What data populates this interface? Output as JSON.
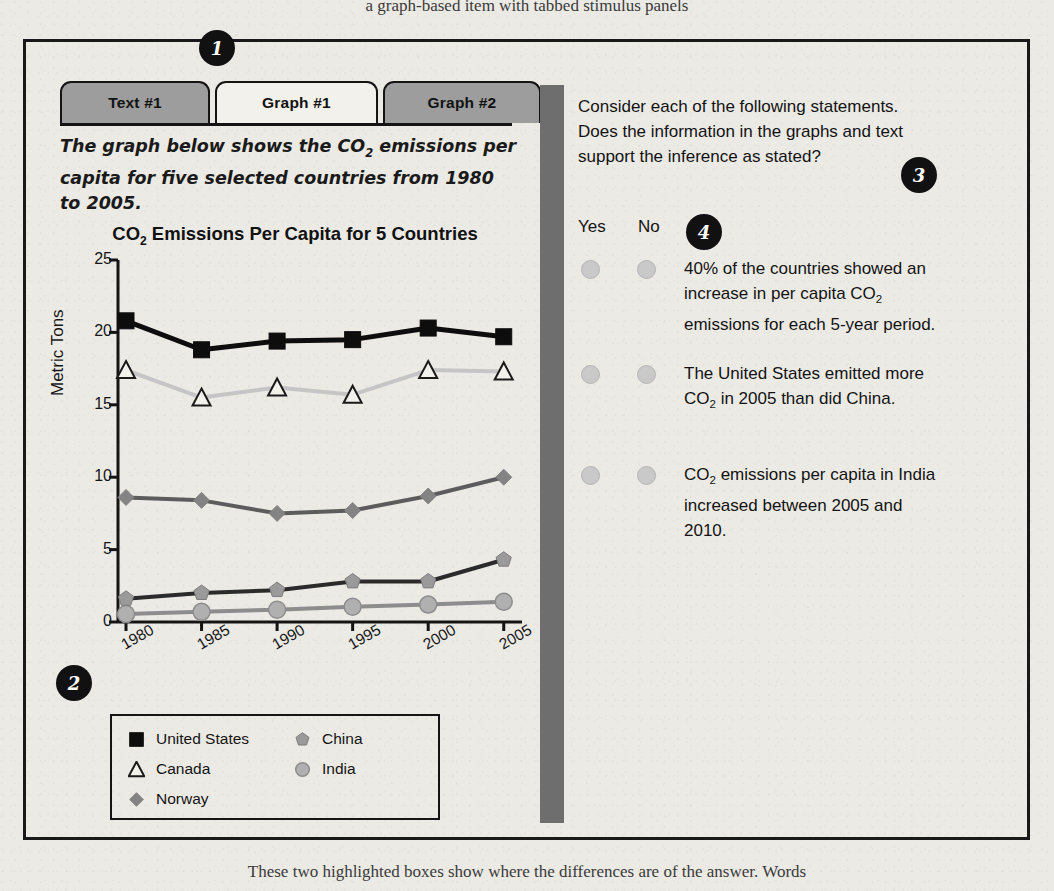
{
  "page": {
    "top_cropped_text": "a  graph-based item with tabbed stimulus panels",
    "bottom_cropped_text": "These two highlighted boxes show where the differences are of the answer. Words"
  },
  "tabs": [
    {
      "label": "Text #1",
      "active": false,
      "name": "tab-text-1"
    },
    {
      "label": "Graph #1",
      "active": true,
      "name": "tab-graph-1"
    },
    {
      "label": "Graph #2",
      "active": false,
      "name": "tab-graph-2"
    }
  ],
  "prompt": {
    "line1_a": "The graph below shows the CO",
    "line1_sub": "2",
    "line1_b": " emissions per",
    "line2": "capita for five selected countries from 1980 to 2005."
  },
  "chart_data": {
    "type": "line",
    "title_a": "CO",
    "title_sub": "2",
    "title_b": " Emissions Per Capita for 5 Countries",
    "title": "CO2 Emissions Per Capita for 5 Countries",
    "xlabel": "",
    "ylabel": "Metric Tons",
    "categories": [
      "1980",
      "1985",
      "1990",
      "1995",
      "2000",
      "2005"
    ],
    "yticks": [
      0,
      5,
      10,
      15,
      20,
      25
    ],
    "ylim": [
      0,
      25
    ],
    "grid": false,
    "legend_position": "below-plot",
    "series": [
      {
        "name": "United States",
        "marker": "filled-square",
        "color": "#0d0d0d",
        "line_color": "#0d0d0d",
        "values": [
          20.8,
          18.8,
          19.4,
          19.5,
          20.3,
          19.7
        ]
      },
      {
        "name": "Canada",
        "marker": "open-triangle",
        "color": "#ffffff",
        "line_color": "#c5c5c5",
        "values": [
          17.4,
          15.5,
          16.2,
          15.7,
          17.4,
          17.3
        ]
      },
      {
        "name": "Norway",
        "marker": "filled-diamond",
        "color": "#838383",
        "line_color": "#5c5c5c",
        "values": [
          8.6,
          8.4,
          7.5,
          7.7,
          8.7,
          10.0
        ]
      },
      {
        "name": "China",
        "marker": "filled-pentagon",
        "color": "#9a9a9a",
        "line_color": "#2b2b2b",
        "values": [
          1.6,
          2.0,
          2.2,
          2.8,
          2.8,
          4.3
        ]
      },
      {
        "name": "India",
        "marker": "filled-circle",
        "color": "#b0b0b0",
        "line_color": "#8d8d8d",
        "values": [
          0.55,
          0.7,
          0.85,
          1.05,
          1.2,
          1.4
        ]
      }
    ]
  },
  "question": {
    "line1": "Consider each of the following statements.",
    "line2": "Does the information in the graphs and text",
    "line3": "support the inference as stated?"
  },
  "columns": {
    "yes": "Yes",
    "no": "No"
  },
  "statements": [
    {
      "id": "statement-1",
      "line1_a": "40% of the countries showed an",
      "line2_a": "increase in per capita CO",
      "line2_sub": "2",
      "line3_a": "emissions for each 5-year period.",
      "text": "40% of the countries showed an increase in per capita CO2 emissions for each 5-year period."
    },
    {
      "id": "statement-2",
      "line1_a": "The United States emitted more",
      "line2_a": "CO",
      "line2_sub": "2",
      "line2_b": " in 2005 than did China.",
      "text": "The United States emitted more CO2 in 2005 than did China."
    },
    {
      "id": "statement-3",
      "line1_a": "CO",
      "line1_sub": "2",
      "line1_b": " emissions per capita in India",
      "line2_a": "increased between 2005 and",
      "line3_a": "2010.",
      "text": "CO2 emissions per capita in India increased between 2005 and 2010."
    }
  ],
  "callouts": [
    {
      "number": "1",
      "name": "callout-1"
    },
    {
      "number": "2",
      "name": "callout-2"
    },
    {
      "number": "3",
      "name": "callout-3"
    },
    {
      "number": "4",
      "name": "callout-4"
    }
  ],
  "colors": {
    "frame": "#191919",
    "tab_inactive": "#9d9d9d",
    "tab_active": "#f3f1ec",
    "divider": "#6e6e6e",
    "radio": "#c9c9c9",
    "callout": "#111111"
  }
}
